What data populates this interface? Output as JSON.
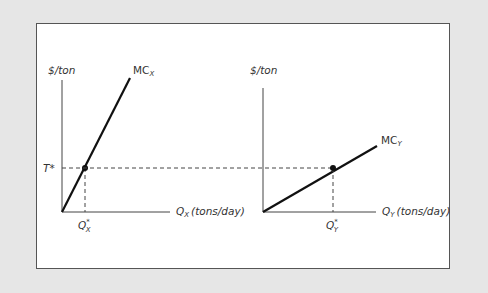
{
  "diagram": {
    "type": "two-panel marginal cost diagram",
    "colors": {
      "background": "#e6e6e6",
      "panel": "#ffffff",
      "border": "#555555",
      "curve": "#111111",
      "axis": "#444444",
      "dashed": "#444444"
    },
    "left_panel": {
      "y_axis_label": "$/ton",
      "x_axis_label_main": "Q",
      "x_axis_label_sub": "X",
      "x_axis_label_unit": "(tons/day)",
      "curve_label_main": "MC",
      "curve_label_sub": "X",
      "price_label": "T*",
      "quantity_label_main": "Q",
      "quantity_label_sup": "*",
      "quantity_label_sub": "X"
    },
    "right_panel": {
      "y_axis_label": "$/ton",
      "x_axis_label_main": "Q",
      "x_axis_label_sub": "Y",
      "x_axis_label_unit": "(tons/day)",
      "curve_label_main": "MC",
      "curve_label_sub": "Y",
      "quantity_label_main": "Q",
      "quantity_label_sup": "*",
      "quantity_label_sub": "Y"
    }
  }
}
